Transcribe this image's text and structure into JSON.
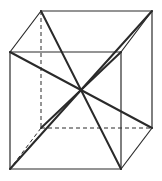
{
  "diagram": {
    "type": "cube-with-space-diagonals",
    "stroke_color": "#2a2a2a",
    "background": "#ffffff",
    "vertices": {
      "back_top_left": [
        41,
        11
      ],
      "back_top_right": [
        152,
        11
      ],
      "front_top_left": [
        10,
        52
      ],
      "front_top_right": [
        121,
        52
      ],
      "back_bottom_left": [
        41,
        128
      ],
      "back_bottom_right": [
        152,
        128
      ],
      "front_bottom_left": [
        10,
        169
      ],
      "front_bottom_right": [
        121,
        169
      ]
    },
    "center": [
      81,
      90
    ],
    "visible_edges": [
      [
        "back_top_left",
        "back_top_right"
      ],
      [
        "front_top_left",
        "front_top_right"
      ],
      [
        "back_top_left",
        "front_top_left"
      ],
      [
        "back_top_right",
        "front_top_right"
      ],
      [
        "front_top_left",
        "front_bottom_left"
      ],
      [
        "front_top_right",
        "front_bottom_right"
      ],
      [
        "back_top_right",
        "back_bottom_right"
      ],
      [
        "front_bottom_left",
        "front_bottom_right"
      ],
      [
        "back_bottom_right",
        "front_bottom_right"
      ]
    ],
    "hidden_edges": [
      [
        "back_top_left",
        "back_bottom_left"
      ],
      [
        "back_bottom_left",
        "back_bottom_right"
      ],
      [
        "back_bottom_left",
        "front_bottom_left"
      ]
    ],
    "diagonals": [
      [
        "back_top_left",
        "front_bottom_right"
      ],
      [
        "front_top_left",
        "back_bottom_right"
      ],
      [
        "front_bottom_left",
        "back_top_right"
      ],
      [
        "back_bottom_left",
        "front_top_right"
      ]
    ]
  }
}
